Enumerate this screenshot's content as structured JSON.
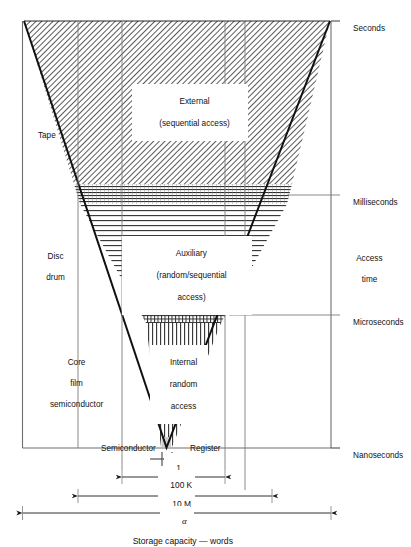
{
  "figure": {
    "caption": "Storage capacity — words",
    "alpha_symbol": "α"
  },
  "regions": [
    {
      "id": "external",
      "line1": "External",
      "line2": "(sequential access)",
      "hatch": "diagonal"
    },
    {
      "id": "auxiliary",
      "line1": "Auxiliary",
      "line2": "(random/sequential",
      "line3": "access)",
      "hatch": "horizontal"
    },
    {
      "id": "internal",
      "line1": "Internal",
      "line2": "random",
      "line3": "access",
      "hatch": "vertical"
    }
  ],
  "left_labels": [
    {
      "id": "tape",
      "text": "Tape"
    },
    {
      "id": "disc-drum",
      "line1": "Disc",
      "line2": "drum"
    },
    {
      "id": "core-film-semiconductor",
      "line1": "Core",
      "line2": "film",
      "line3": "semiconductor"
    }
  ],
  "bottom_labels": [
    {
      "id": "semiconductor",
      "text": "Semiconductor"
    },
    {
      "id": "register",
      "text": "Register"
    }
  ],
  "right_axis": {
    "title_line1": "Access",
    "title_line2": "time",
    "ticks": [
      {
        "id": "seconds",
        "label": "Seconds"
      },
      {
        "id": "milliseconds",
        "label": "Milliseconds"
      },
      {
        "id": "microseconds",
        "label": "Microseconds"
      },
      {
        "id": "nanoseconds",
        "label": "Nanoseconds"
      }
    ]
  },
  "dimensions": [
    {
      "id": "one-word",
      "label": "1"
    },
    {
      "id": "hundred-k",
      "label": "100 K"
    },
    {
      "id": "ten-m",
      "label": "10 M"
    },
    {
      "id": "alpha",
      "label": "α"
    }
  ],
  "colors": {
    "line": "#1a1a1a",
    "thin_line": "#6f6f6f",
    "hatch": "#3a3a3a",
    "background": "#ffffff"
  }
}
